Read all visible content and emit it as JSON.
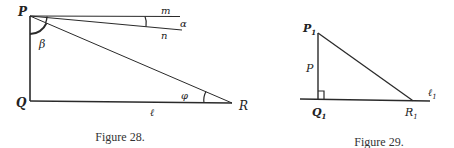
{
  "figure28": {
    "caption": "Figure 28.",
    "labels": {
      "P": "P",
      "Q": "Q",
      "R": "R",
      "m": "m",
      "n": "n",
      "alpha": "α",
      "beta": "β",
      "phi": "φ",
      "l": "ℓ"
    }
  },
  "figure29": {
    "caption": "Figure 29.",
    "labels": {
      "P1_main": "P",
      "P1_sub": "1",
      "p": "P",
      "Q1_main": "Q",
      "Q1_sub": "1",
      "R1_main": "R",
      "R1_sub": "1",
      "l1_main": "ℓ",
      "l1_sub": "1"
    }
  },
  "colors": {
    "ink": "#2a2a2a",
    "background": "#ffffff"
  }
}
